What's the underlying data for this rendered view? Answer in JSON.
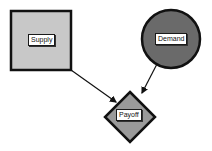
{
  "diagram": {
    "nodes": [
      {
        "id": "supply",
        "label": "Supply",
        "shape": "square",
        "fill": "#c8c8c8",
        "stroke": "#111111",
        "x": 11,
        "y": 11,
        "width": 60,
        "height": 59
      },
      {
        "id": "demand",
        "label": "Demand",
        "shape": "circle",
        "fill": "#6a6a6a",
        "stroke": "#111111",
        "cx": 171,
        "cy": 39,
        "r": 29
      },
      {
        "id": "payoff",
        "label": "Payoff",
        "shape": "diamond",
        "fill": "#9a9a9a",
        "stroke": "#111111",
        "cx": 130,
        "cy": 117,
        "rx": 25,
        "ry": 25
      }
    ],
    "edges": [
      {
        "from": "supply",
        "to": "payoff",
        "x1": 71,
        "y1": 70,
        "x2": 117,
        "y2": 103
      },
      {
        "from": "demand",
        "to": "payoff",
        "x1": 157,
        "y1": 64,
        "x2": 141,
        "y2": 95
      }
    ]
  }
}
